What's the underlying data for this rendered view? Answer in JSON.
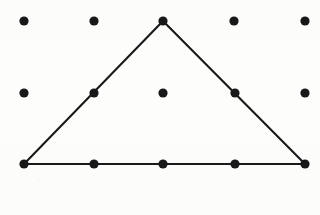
{
  "figure": {
    "name": "geoboard-dot-grid-triangle",
    "kind": "geometry-lattice-figure",
    "width": 320,
    "height": 215,
    "background_color": "#fdfdfc",
    "ink_color": "#1a1a1a",
    "dot_color": "#191919",
    "dot_radius": 4.6,
    "edge_stroke_width": 2.1
  },
  "grid": {
    "rows": 3,
    "columns": 5,
    "total_points": 15,
    "column_x": [
      24,
      94,
      163,
      234,
      305
    ],
    "row_y": [
      21,
      93,
      164
    ],
    "spacing_x": 70,
    "spacing_y": 71.5,
    "points": [
      {
        "id": "r0c0",
        "row": 0,
        "col": 0,
        "x": 24,
        "y": 21,
        "on_shape": false
      },
      {
        "id": "r0c1",
        "row": 0,
        "col": 1,
        "x": 94,
        "y": 21,
        "on_shape": false
      },
      {
        "id": "r0c2",
        "row": 0,
        "col": 2,
        "x": 163,
        "y": 21,
        "on_shape": true
      },
      {
        "id": "r0c3",
        "row": 0,
        "col": 3,
        "x": 234,
        "y": 21,
        "on_shape": false
      },
      {
        "id": "r0c4",
        "row": 0,
        "col": 4,
        "x": 305,
        "y": 21,
        "on_shape": false
      },
      {
        "id": "r1c0",
        "row": 1,
        "col": 0,
        "x": 24,
        "y": 93,
        "on_shape": false
      },
      {
        "id": "r1c1",
        "row": 1,
        "col": 1,
        "x": 94,
        "y": 93,
        "on_shape": true
      },
      {
        "id": "r1c2",
        "row": 1,
        "col": 2,
        "x": 163,
        "y": 93,
        "on_shape": false
      },
      {
        "id": "r1c3",
        "row": 1,
        "col": 3,
        "x": 235,
        "y": 93,
        "on_shape": true
      },
      {
        "id": "r1c4",
        "row": 1,
        "col": 4,
        "x": 305,
        "y": 93,
        "on_shape": false
      },
      {
        "id": "r2c0",
        "row": 2,
        "col": 0,
        "x": 24,
        "y": 164,
        "on_shape": true
      },
      {
        "id": "r2c1",
        "row": 2,
        "col": 1,
        "x": 94,
        "y": 164,
        "on_shape": true
      },
      {
        "id": "r2c2",
        "row": 2,
        "col": 2,
        "x": 163,
        "y": 164,
        "on_shape": true
      },
      {
        "id": "r2c3",
        "row": 2,
        "col": 3,
        "x": 235,
        "y": 164,
        "on_shape": true
      },
      {
        "id": "r2c4",
        "row": 2,
        "col": 4,
        "x": 305,
        "y": 164,
        "on_shape": true
      }
    ]
  },
  "shape": {
    "name": "triangle",
    "type": "isosceles-triangle",
    "closed": true,
    "vertices": [
      {
        "label": "apex",
        "lattice": "r0c2",
        "x": 163,
        "y": 21
      },
      {
        "label": "bottom-right",
        "lattice": "r2c4",
        "x": 305,
        "y": 164
      },
      {
        "label": "bottom-left",
        "lattice": "r2c0",
        "x": 24,
        "y": 164
      }
    ],
    "path": "M 163 21 L 305 164 L 24 164 Z",
    "edges": [
      {
        "name": "left-edge",
        "from": "r2c0",
        "to": "r0c2",
        "x1": 24,
        "y1": 164,
        "x2": 163,
        "y2": 21
      },
      {
        "name": "right-edge",
        "from": "r0c2",
        "to": "r2c4",
        "x1": 163,
        "y1": 21,
        "x2": 305,
        "y2": 164
      },
      {
        "name": "bottom-edge",
        "from": "r2c0",
        "to": "r2c4",
        "x1": 24,
        "y1": 164,
        "x2": 305,
        "y2": 164
      }
    ]
  }
}
